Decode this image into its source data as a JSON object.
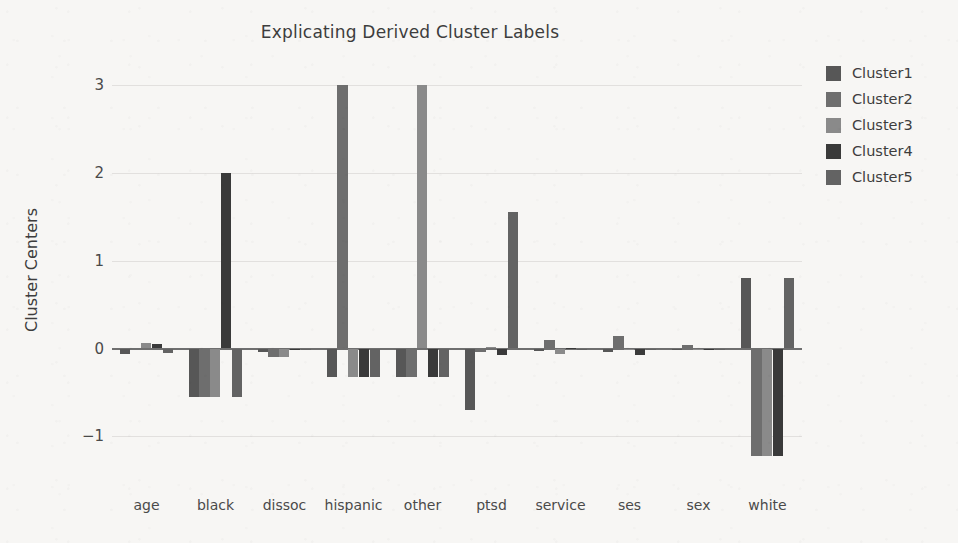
{
  "chart_data": {
    "type": "bar",
    "title": "Explicating Derived Cluster Labels",
    "xlabel": "",
    "ylabel": "Cluster Centers",
    "categories": [
      "age",
      "black",
      "dissoc",
      "hispanic",
      "other",
      "ptsd",
      "service",
      "ses",
      "sex",
      "white"
    ],
    "ylim": [
      -1.35,
      3.15
    ],
    "yticks": [
      3,
      2,
      1,
      0,
      -1
    ],
    "ytick_labels": [
      "3",
      "2",
      "1",
      "0",
      "−1"
    ],
    "grid": true,
    "legend_position": "right",
    "colors": {
      "Cluster1": "#575757",
      "Cluster2": "#6e6e6e",
      "Cluster3": "#8a8a8a",
      "Cluster4": "#3a3a3a",
      "Cluster5": "#636363"
    },
    "series": [
      {
        "name": "Cluster1",
        "values": [
          -0.06,
          -0.55,
          -0.04,
          -0.33,
          -0.33,
          -0.7,
          -0.03,
          -0.04,
          -0.02,
          0.8
        ]
      },
      {
        "name": "Cluster2",
        "values": [
          0.01,
          -0.55,
          -0.1,
          3.0,
          -0.33,
          -0.04,
          0.1,
          0.14,
          0.04,
          -1.22
        ]
      },
      {
        "name": "Cluster3",
        "values": [
          0.06,
          -0.55,
          -0.1,
          -0.33,
          3.0,
          0.02,
          -0.06,
          -0.02,
          0.0,
          -1.22
        ]
      },
      {
        "name": "Cluster4",
        "values": [
          0.05,
          2.0,
          -0.02,
          -0.33,
          -0.33,
          -0.07,
          0.01,
          -0.07,
          -0.01,
          -1.22
        ]
      },
      {
        "name": "Cluster5",
        "values": [
          -0.05,
          -0.55,
          0.0,
          -0.33,
          -0.33,
          1.55,
          0.0,
          -0.01,
          0.0,
          0.8
        ]
      }
    ]
  },
  "legend": {
    "items": [
      {
        "label": "Cluster1"
      },
      {
        "label": "Cluster2"
      },
      {
        "label": "Cluster3"
      },
      {
        "label": "Cluster4"
      },
      {
        "label": "Cluster5"
      }
    ]
  }
}
